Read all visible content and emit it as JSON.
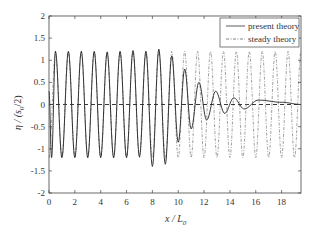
{
  "chart_data": {
    "type": "line",
    "title": "",
    "xlabel": "x / L0",
    "ylabel": "η / (s0/2)",
    "xlim": [
      0,
      19.5
    ],
    "ylim": [
      -2,
      2
    ],
    "xticks": [
      0,
      2,
      4,
      6,
      8,
      10,
      12,
      14,
      16,
      18
    ],
    "yticks": [
      -2,
      -1.5,
      -1,
      -0.5,
      0,
      0.5,
      1,
      1.5,
      2
    ],
    "ytick_labels": [
      "-2",
      "-1.5",
      "-1",
      "-0.5",
      "0",
      "0.5",
      "1",
      "1.5",
      "2"
    ],
    "grid": false,
    "legend_position": "upper right",
    "zero_line": {
      "style": "dashed",
      "y": 0
    },
    "series": [
      {
        "name": "present theory",
        "style": "solid",
        "description": "oscillation with wavelength ~1 L0, amplitude ~1.2 up to x≈9, then decaying amplitude and lengthening wavelength toward 0 at x≈19.5",
        "x": [
          0,
          0.5,
          1.5,
          2.5,
          3.5,
          4.5,
          5.5,
          6.5,
          7.5,
          8.5,
          9.0,
          9.5,
          10.0,
          10.5,
          11.0,
          11.6,
          12.2,
          12.9,
          13.6,
          14.3,
          15.1,
          16.0,
          17.0,
          18.2,
          19.5
        ],
        "peaks_x": [
          0.5,
          1.5,
          2.5,
          3.5,
          4.5,
          5.5,
          6.5,
          7.5,
          8.5,
          9.5,
          10.5,
          11.6,
          12.9,
          14.3,
          16.2,
          18.0
        ],
        "peaks_y": [
          1.2,
          1.2,
          1.2,
          1.2,
          1.18,
          1.2,
          1.22,
          1.2,
          1.25,
          1.1,
          0.8,
          0.5,
          0.3,
          0.15,
          0.1,
          0.05
        ],
        "troughs_x": [
          0.2,
          1.0,
          2.0,
          3.0,
          4.0,
          5.0,
          6.0,
          7.0,
          8.0,
          9.0,
          10.0,
          11.0,
          12.2,
          13.6,
          15.1
        ],
        "troughs_y": [
          -1.2,
          -1.2,
          -1.2,
          -1.2,
          -1.2,
          -1.2,
          -1.2,
          -1.18,
          -1.4,
          -1.35,
          -0.85,
          -0.55,
          -0.35,
          -0.2,
          -0.1
        ]
      },
      {
        "name": "steady theory",
        "style": "dashdot",
        "description": "steady oscillation with amplitude ~1.2 and wavelength ~1 L0 over the full range",
        "amplitude": 1.2,
        "wavelength": 1.0
      }
    ]
  },
  "legend": {
    "items": [
      {
        "label": "present theory",
        "style": "solid"
      },
      {
        "label": "steady theory",
        "style": "dashdot"
      }
    ]
  },
  "axes": {
    "xlabel_main": "x / L",
    "xlabel_sub": "0",
    "ylabel_main": "η / (s",
    "ylabel_sub": "0",
    "ylabel_tail": "/2)"
  }
}
